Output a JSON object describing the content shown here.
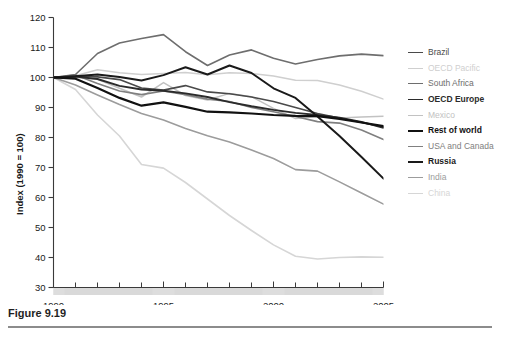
{
  "figure": {
    "caption": "Figure 9.19"
  },
  "chart_data": {
    "type": "line",
    "title": "",
    "xlabel": "",
    "ylabel": "Index (1990 = 100)",
    "xlim": [
      1990,
      2005
    ],
    "ylim": [
      30,
      120
    ],
    "grid": false,
    "legend_position": "right",
    "y_ticks": [
      30,
      40,
      50,
      60,
      70,
      80,
      90,
      100,
      110,
      120
    ],
    "y_tick_labels": [
      "30",
      "40",
      "50",
      "60",
      "70",
      "80",
      "90",
      "100",
      "110",
      "120"
    ],
    "x_ticks": [
      1990,
      1991,
      1992,
      1993,
      1994,
      1995,
      1996,
      1997,
      1998,
      1999,
      2000,
      2001,
      2002,
      2003,
      2004,
      2005
    ],
    "x_tick_labels_major": [
      "1990",
      "1995",
      "2000",
      "2005"
    ],
    "x_major_ticks": [
      1990,
      1995,
      2000,
      2005
    ],
    "x": [
      1990,
      1991,
      1992,
      1993,
      1994,
      1995,
      1996,
      1997,
      1998,
      1999,
      2000,
      2001,
      2002,
      2003,
      2004,
      2005
    ],
    "series": [
      {
        "name": "Brazil",
        "color": "#4a4a4a",
        "width": 1.6,
        "values": [
          100,
          100.5,
          100.2,
          99.3,
          96.5,
          95.8,
          97.3,
          95.2,
          94.6,
          93.5,
          92.0,
          90.0,
          88.0,
          86.5,
          85.0,
          83.5
        ]
      },
      {
        "name": "OECD Pacific",
        "color": "#cfcfcf",
        "width": 1.5,
        "values": [
          100,
          100.6,
          102.6,
          101.6,
          101.0,
          101.3,
          101.7,
          100.9,
          101.6,
          101.3,
          100.5,
          99.1,
          99.0,
          97.5,
          95.4,
          92.8
        ]
      },
      {
        "name": "South Africa",
        "color": "#6e6e6e",
        "width": 1.6,
        "values": [
          100,
          101.0,
          108.0,
          111.5,
          113.0,
          114.3,
          108.6,
          104.0,
          107.5,
          109.2,
          106.4,
          104.5,
          106.0,
          107.2,
          107.8,
          107.3
        ]
      },
      {
        "name": "OECD Europe",
        "color": "#2b2b2b",
        "width": 1.9,
        "values": [
          100,
          100.3,
          99.5,
          97.2,
          96.0,
          95.6,
          94.7,
          93.5,
          91.8,
          90.4,
          89.2,
          88.2,
          87.5,
          86.6,
          85.2,
          83.2
        ]
      },
      {
        "name": "Mexico",
        "color": "#c2c2c2",
        "width": 1.5,
        "values": [
          100,
          100.0,
          99.4,
          96.4,
          93.5,
          98.3,
          94.0,
          92.5,
          94.7,
          93.6,
          89.7,
          86.3,
          87.0,
          86.5,
          86.8,
          87.1
        ]
      },
      {
        "name": "Rest of world",
        "color": "#111111",
        "width": 2.2,
        "values": [
          100,
          99.6,
          96.5,
          93.2,
          90.6,
          91.7,
          90.2,
          88.6,
          88.4,
          88.0,
          87.5,
          87.2,
          87.1,
          86.2,
          85.0,
          83.8
        ]
      },
      {
        "name": "USA and Canada",
        "color": "#808080",
        "width": 1.6,
        "values": [
          100,
          100.8,
          98.0,
          95.5,
          94.3,
          95.5,
          94.3,
          92.8,
          92.0,
          90.0,
          88.6,
          87.0,
          85.3,
          84.8,
          82.5,
          79.3
        ]
      },
      {
        "name": "Russia",
        "color": "#1a1a1a",
        "width": 2.0,
        "values": [
          100,
          100.4,
          101.0,
          100.2,
          99.0,
          100.8,
          103.4,
          101.0,
          104.0,
          101.5,
          96.4,
          93.2,
          87.0,
          80.5,
          73.5,
          66.3
        ]
      },
      {
        "name": "India",
        "color": "#9c9c9c",
        "width": 1.6,
        "values": [
          100,
          97.5,
          94.2,
          91.0,
          88.0,
          85.8,
          83.0,
          80.6,
          78.5,
          75.8,
          73.0,
          69.3,
          68.8,
          65.2,
          61.5,
          57.8
        ]
      },
      {
        "name": "China",
        "color": "#d6d6d6",
        "width": 1.6,
        "values": [
          100,
          96.0,
          87.5,
          80.5,
          71.0,
          69.8,
          65.0,
          59.5,
          54.0,
          49.0,
          44.2,
          40.4,
          39.5,
          40.0,
          40.2,
          40.1
        ]
      }
    ]
  },
  "legend": {
    "items": [
      {
        "label": "Brazil"
      },
      {
        "label": "OECD Pacific"
      },
      {
        "label": "South Africa"
      },
      {
        "label": "OECD Europe"
      },
      {
        "label": "Mexico"
      },
      {
        "label": "Rest of world"
      },
      {
        "label": "USA and Canada"
      },
      {
        "label": "Russia"
      },
      {
        "label": "India"
      },
      {
        "label": "China"
      }
    ]
  },
  "axis_band": {
    "color": "#b9b9b9",
    "highlight_color": "#dddddd"
  }
}
